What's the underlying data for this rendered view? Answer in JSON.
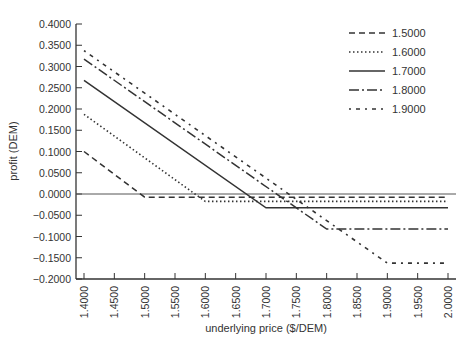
{
  "chart_data": {
    "type": "line",
    "title": "",
    "xlabel": "underlying price ($/DEM)",
    "ylabel": "profit (DEM)",
    "xlim": [
      1.4,
      2.0
    ],
    "ylim": [
      -0.2,
      0.4
    ],
    "grid": false,
    "legend_position": "upper right",
    "x_ticks": [
      "1.4000",
      "1.4500",
      "1.5000",
      "1.5500",
      "1.6000",
      "1.6500",
      "1.7000",
      "1.7500",
      "1.8000",
      "1.8500",
      "1.9000",
      "1.9500",
      "2.0000"
    ],
    "y_ticks": [
      "0.4000",
      "0.3500",
      "0.3000",
      "0.2500",
      "0.2000",
      "0.1500",
      "0.1000",
      "0.0500",
      "0.0000",
      "-0.0500",
      "-0.1000",
      "-0.1500",
      "-0.2000"
    ],
    "x": [
      1.4,
      1.5,
      1.6,
      1.7,
      1.8,
      1.9,
      2.0
    ],
    "series": [
      {
        "name": "1.5000",
        "style": "dashed",
        "points": [
          [
            1.4,
            0.1
          ],
          [
            1.5,
            -0.0075
          ],
          [
            2.0,
            -0.0075
          ]
        ]
      },
      {
        "name": "1.6000",
        "style": "dotted",
        "points": [
          [
            1.4,
            0.1875
          ],
          [
            1.6,
            -0.0175
          ],
          [
            2.0,
            -0.0175
          ]
        ]
      },
      {
        "name": "1.7000",
        "style": "solid",
        "points": [
          [
            1.4,
            0.2675
          ],
          [
            1.7,
            -0.0325
          ],
          [
            2.0,
            -0.0325
          ]
        ]
      },
      {
        "name": "1.8000",
        "style": "dash-dot",
        "points": [
          [
            1.4,
            0.3175
          ],
          [
            1.8,
            -0.0825
          ],
          [
            2.0,
            -0.0825
          ]
        ]
      },
      {
        "name": "1.9000",
        "style": "dash-dot-dot",
        "points": [
          [
            1.4,
            0.3375
          ],
          [
            1.9,
            -0.1625
          ],
          [
            2.0,
            -0.1625
          ]
        ]
      }
    ],
    "zero_line": 0.0
  },
  "legend": {
    "items": [
      "1.5000",
      "1.6000",
      "1.7000",
      "1.8000",
      "1.9000"
    ]
  },
  "axes": {
    "xlabel": "underlying price ($/DEM)",
    "ylabel": "profit (DEM)"
  }
}
